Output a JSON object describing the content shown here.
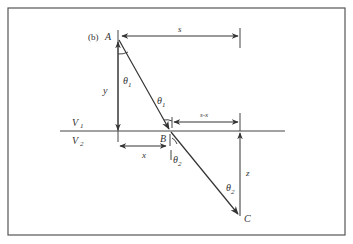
{
  "figure": {
    "panel_label": "(b)",
    "points": {
      "A": "A",
      "B": "B",
      "C": "C"
    },
    "dimensions": {
      "s": "s",
      "y": "y",
      "x": "x",
      "s_minus_x": "s-x",
      "z": "z"
    },
    "angles": {
      "theta": "θ",
      "sub1": "1",
      "sub2": "2"
    },
    "media": {
      "v_letter": "V",
      "v1_sub": "1",
      "v2_sub": "2"
    },
    "colors": {
      "stroke": "#333333",
      "border": "#555555",
      "background": "#ffffff"
    }
  }
}
